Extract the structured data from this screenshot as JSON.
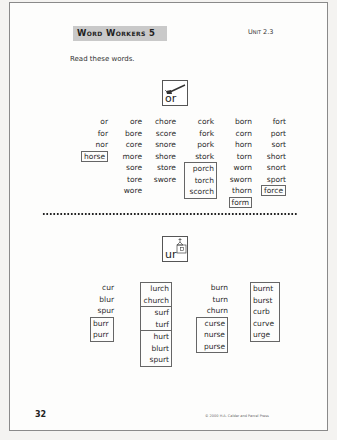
{
  "header": {
    "title": "Word Workers 5",
    "unit": "Unit 2.3"
  },
  "instructions": "Read these words.",
  "or_section": {
    "key": {
      "text": "or",
      "icon": "fork-icon"
    },
    "columns": [
      {
        "words": [
          "or",
          "for",
          "nor",
          "horse"
        ],
        "boxed": [
          "horse"
        ]
      },
      {
        "words": [
          "ore",
          "bore",
          "core",
          "more",
          "sore",
          "tore",
          "wore"
        ],
        "boxed": []
      },
      {
        "words": [
          "chore",
          "score",
          "snore",
          "shore",
          "store",
          "swore"
        ],
        "boxed": []
      },
      {
        "words": [
          "cork",
          "fork",
          "pork",
          "stork",
          "porch",
          "torch",
          "scorch"
        ],
        "boxed_group": [
          "porch",
          "torch",
          "scorch"
        ]
      },
      {
        "words": [
          "born",
          "corn",
          "horn",
          "torn",
          "worn",
          "sworn",
          "thorn",
          "form"
        ],
        "boxed": [
          "form"
        ]
      },
      {
        "words": [
          "fort",
          "port",
          "sort",
          "short",
          "snort",
          "sport",
          "force"
        ],
        "boxed": [
          "force"
        ]
      }
    ]
  },
  "ur_section": {
    "key": {
      "text": "ur",
      "icon": "church-icon"
    },
    "columns": [
      {
        "words": [
          "cur",
          "blur",
          "spur",
          "burr",
          "purr"
        ],
        "boxed_group": [
          "burr",
          "purr"
        ]
      },
      {
        "words": [
          "lurch",
          "church",
          "surf",
          "turf",
          "hurt",
          "blurt",
          "spurt"
        ],
        "groups": [
          [
            "lurch",
            "church"
          ],
          [
            "surf",
            "turf"
          ],
          [
            "hurt",
            "blurt",
            "spurt"
          ]
        ]
      },
      {
        "words": [
          "burn",
          "turn",
          "churn",
          "curse",
          "nurse",
          "purse"
        ],
        "boxed_group": [
          "curse",
          "nurse",
          "purse"
        ]
      },
      {
        "words": [
          "burnt",
          "burst",
          "curb",
          "curve",
          "urge"
        ],
        "boxed_group": [
          "burnt",
          "burst",
          "curb",
          "curve",
          "urge"
        ]
      }
    ]
  },
  "footer": {
    "page_number": "32",
    "copyright": "© 2000 H.A. Calder and Parcel Press"
  }
}
